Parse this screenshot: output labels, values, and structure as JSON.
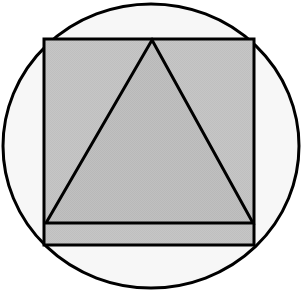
{
  "figure": {
    "canvas": {
      "width": 308,
      "height": 293,
      "background": "#ffffff"
    },
    "shapes": {
      "circle": {
        "name": "outer-circle",
        "label": "Circle",
        "cx": 151,
        "cy": 146,
        "rx": 148,
        "ry": 142,
        "fill": "#f7f7f7",
        "stroke": "#000000",
        "stroke_width": 3
      },
      "square": {
        "name": "inscribed-square",
        "label": "Square",
        "x": 44,
        "y": 39,
        "width": 210,
        "height": 206,
        "fill": "#c5c5c5",
        "stroke": "#000000",
        "stroke_width": 3
      },
      "triangle": {
        "name": "inscribed-triangle",
        "label": "Triangle",
        "points": "152,40 253,223 46,223",
        "apex_x": 152,
        "apex_y": 40,
        "base_left_x": 46,
        "base_right_x": 253,
        "base_y": 223,
        "fill": "#bdbdbd",
        "stroke": "#000000",
        "stroke_width": 3
      }
    }
  }
}
